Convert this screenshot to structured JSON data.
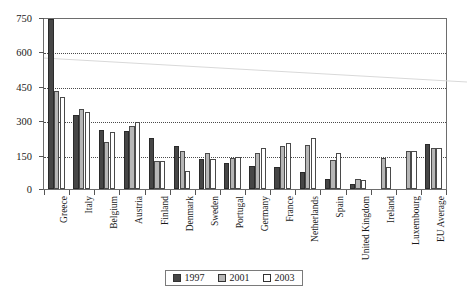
{
  "chart_data": {
    "type": "bar",
    "title": "",
    "subtitle": "",
    "xlabel": "",
    "ylabel": "",
    "ylim": [
      0,
      750
    ],
    "yticks": [
      0,
      150,
      300,
      450,
      600,
      750
    ],
    "ytick_labels": [
      "0",
      "150",
      "300",
      "450",
      "600",
      "750"
    ],
    "grid": "horizontal-dotted",
    "legend_position": "bottom-center",
    "categories": [
      "Greece",
      "Italy",
      "Belgium",
      "Austria",
      "Finland",
      "Denmark",
      "Sweden",
      "Portugal",
      "Germany",
      "France",
      "Netherlands",
      "Spain",
      "United Kingdom",
      "Ireland",
      "Luxembourg",
      "EU Average"
    ],
    "series": [
      {
        "name": "1997",
        "color": "#464646",
        "values": [
          745,
          325,
          258,
          253,
          222,
          188,
          130,
          115,
          102,
          98,
          75,
          45,
          22,
          null,
          null,
          198
        ]
      },
      {
        "name": "2001",
        "color": "#b6b6b6",
        "values": [
          428,
          352,
          207,
          275,
          122,
          165,
          158,
          135,
          158,
          188,
          192,
          128,
          42,
          135,
          165,
          180
        ]
      },
      {
        "name": "2003",
        "color": "#ffffff",
        "values": [
          403,
          338,
          250,
          292,
          122,
          78,
          133,
          140,
          178,
          200,
          225,
          160,
          38,
          95,
          168,
          182
        ]
      }
    ],
    "legend": [
      "1997",
      "2001",
      "2003"
    ]
  },
  "legend": {
    "items": [
      {
        "label": "1997",
        "swatch": "series-1997-swatch"
      },
      {
        "label": "2001",
        "swatch": "series-2001-swatch"
      },
      {
        "label": "2003",
        "swatch": "series-2003-swatch"
      }
    ]
  }
}
